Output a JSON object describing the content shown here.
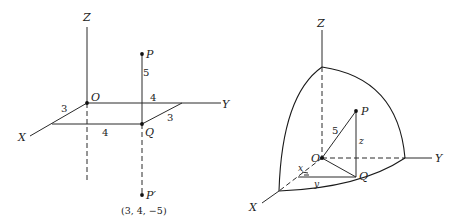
{
  "figure_left": {
    "axes": {
      "z_label": "Z",
      "y_label": "Y",
      "x_label": "X"
    },
    "points": {
      "origin": "O",
      "p": "P",
      "q": "Q",
      "p_prime": "P′"
    },
    "edge_labels": {
      "ox_side": "3",
      "oy_side": "4",
      "far_x_side": "3",
      "near_y_side": "4",
      "pq_length": "5"
    },
    "p_prime_coords": "(3, 4, −5)"
  },
  "figure_right": {
    "axes": {
      "z_label": "Z",
      "y_label": "Y",
      "x_label": "X"
    },
    "points": {
      "origin": "O",
      "p": "P",
      "q": "Q"
    },
    "edge_labels": {
      "op_length": "5",
      "pq_label": "z",
      "x_label": "x",
      "y_label": "y"
    }
  }
}
